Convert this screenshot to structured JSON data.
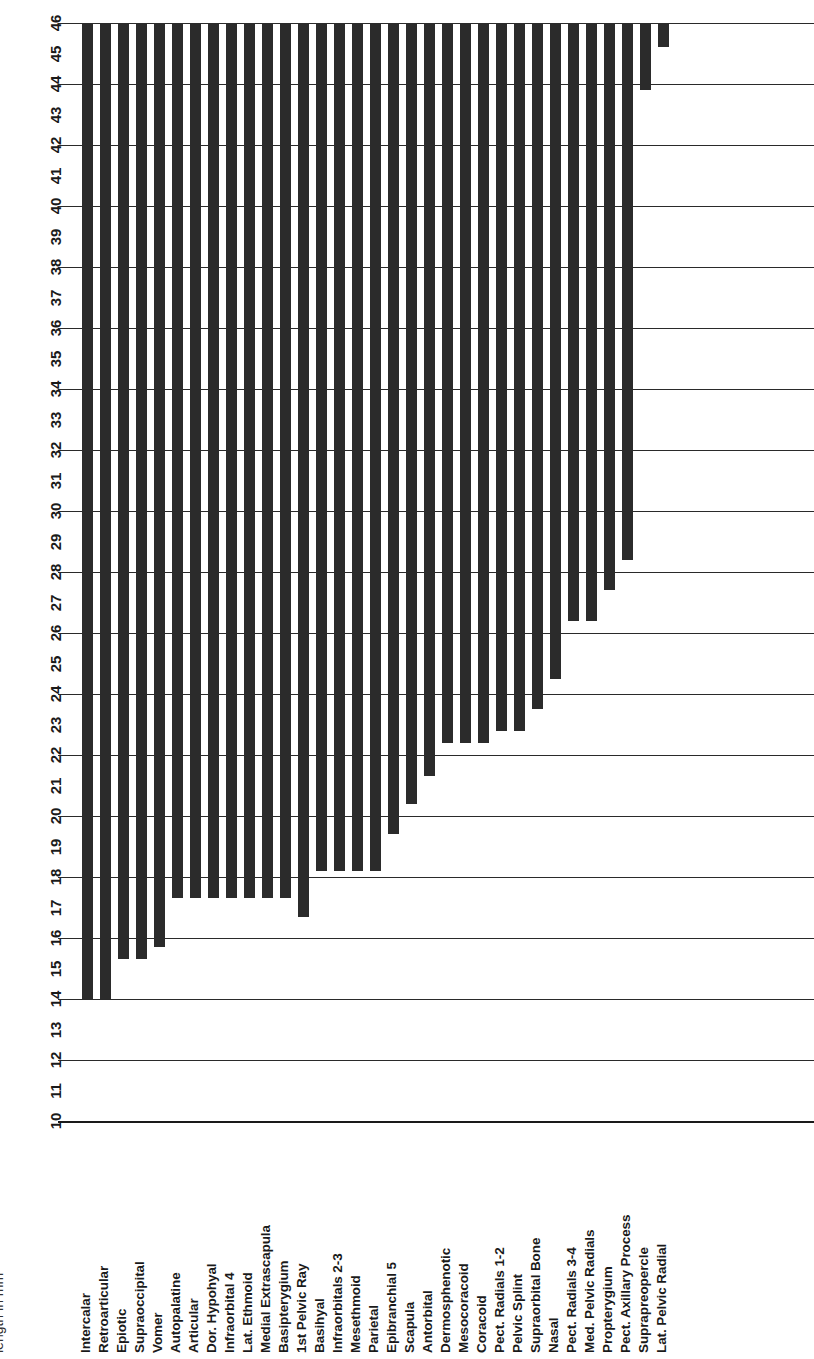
{
  "chart_data": {
    "type": "bar",
    "title": "",
    "subtitle": "",
    "xlabel": "",
    "ylabel": "length in mm",
    "orientation": "vertical-bars-rotated-labels",
    "grid": true,
    "legend": null,
    "ylim": [
      10,
      46
    ],
    "baseline": 46,
    "note": "Bars are drawn hanging from the top of the value axis (46 mm) down to each element's value.",
    "ticks": [
      10,
      11,
      12,
      13,
      14,
      15,
      16,
      17,
      18,
      19,
      20,
      21,
      22,
      23,
      24,
      25,
      26,
      27,
      28,
      29,
      30,
      31,
      32,
      33,
      34,
      35,
      36,
      37,
      38,
      39,
      40,
      41,
      42,
      43,
      44,
      45,
      46
    ],
    "gridline_values": [
      10,
      12,
      14,
      16,
      18,
      20,
      22,
      24,
      26,
      28,
      30,
      32,
      34,
      36,
      38,
      40,
      42,
      44,
      46
    ],
    "categories": [
      "Intercalar",
      "Retroarticular",
      "Epiotic",
      "Supraoccipital",
      "Vomer",
      "Autopalatine",
      "Articular",
      "Dor. Hypohyal",
      "Infraorbital 4",
      "Lat. Ethmoid",
      "Medial Extrascapula",
      "Basipterygium",
      "1st Pelvic Ray",
      "Basihyal",
      "Infraorbitals 2-3",
      "Mesethmoid",
      "Parietal",
      "Epibranchial 5",
      "Scapula",
      "Antorbital",
      "Dermosphenotic",
      "Mesocoracoid",
      "Coracoid",
      "Pect. Radials 1-2",
      "Pelvic Splint",
      "Supraorbital Bone",
      "Nasal",
      "Pect. Radials 3-4",
      "Med. Pelvic Radials",
      "Propterygium",
      "Pect. Axillary Process",
      "Suprapreopercle",
      "Lat. Pelvic Radial"
    ],
    "values": [
      14.0,
      14.0,
      15.3,
      15.3,
      15.7,
      17.3,
      17.3,
      17.3,
      17.3,
      17.3,
      17.3,
      17.3,
      16.7,
      18.2,
      18.2,
      18.2,
      18.2,
      19.4,
      20.4,
      21.3,
      22.4,
      22.4,
      22.4,
      22.8,
      22.8,
      23.5,
      24.5,
      26.4,
      26.4,
      27.4,
      28.4,
      43.8,
      45.2
    ]
  },
  "axis": {
    "title": "length in mm"
  },
  "colors": {
    "bar": "#2b2b2b",
    "gridline": "#2a2a2a",
    "background": "#ffffff",
    "text": "#1a1a1a"
  }
}
